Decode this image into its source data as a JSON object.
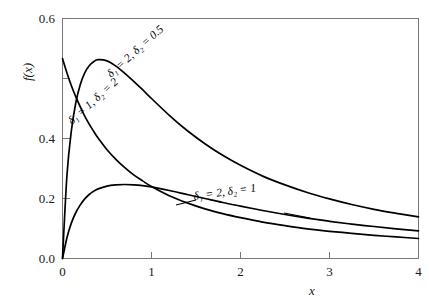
{
  "chart_data": {
    "type": "line",
    "title": "",
    "xlabel": "x",
    "ylabel": "f(x)",
    "xlim": [
      0,
      4
    ],
    "ylim": [
      0,
      0.6
    ],
    "grid": false,
    "legend_position": "inline-annotations",
    "xticks": [
      "0",
      "1",
      "2",
      "3",
      "4"
    ],
    "xtick_values": [
      0,
      1,
      2,
      3,
      4
    ],
    "yticks": [
      "0.0",
      "0.2",
      "0.4",
      "0.6"
    ],
    "ytick_values": [
      0.0,
      0.2,
      0.4,
      0.6
    ],
    "x": [
      0,
      0.05,
      0.1,
      0.15,
      0.2,
      0.25,
      0.3,
      0.35,
      0.4,
      0.5,
      0.6,
      0.7,
      0.8,
      0.9,
      1.0,
      1.2,
      1.4,
      1.6,
      1.8,
      2.0,
      2.25,
      2.5,
      2.75,
      3.0,
      3.25,
      3.5,
      3.75,
      4.0
    ],
    "series": [
      {
        "name": "d1 = 2, d2 = 0.5",
        "label": "δ₁ = 2, δ₂ = 0.5",
        "color": "#000000",
        "values": [
          0.0,
          0.208,
          0.32,
          0.39,
          0.435,
          0.464,
          0.482,
          0.492,
          0.497,
          0.494,
          0.481,
          0.463,
          0.443,
          0.422,
          0.4,
          0.358,
          0.32,
          0.287,
          0.258,
          0.233,
          0.206,
          0.184,
          0.165,
          0.149,
          0.135,
          0.123,
          0.113,
          0.104
        ]
      },
      {
        "name": "d1 = 2, d2 = 1",
        "label": "δ₁ = 2, δ₂ = 1",
        "color": "#000000",
        "values": [
          0.0,
          0.052,
          0.089,
          0.115,
          0.134,
          0.149,
          0.16,
          0.168,
          0.174,
          0.181,
          0.184,
          0.185,
          0.184,
          0.182,
          0.179,
          0.17,
          0.16,
          0.15,
          0.14,
          0.131,
          0.12,
          0.11,
          0.101,
          0.093,
          0.086,
          0.08,
          0.074,
          0.069
        ]
      },
      {
        "name": "d1 = 1, d2 = 2",
        "label": "δ₁ = 1, δ₂ = 2",
        "color": "#000000",
        "values": [
          0.5,
          0.464,
          0.432,
          0.404,
          0.379,
          0.356,
          0.336,
          0.318,
          0.301,
          0.272,
          0.248,
          0.227,
          0.209,
          0.194,
          0.18,
          0.157,
          0.139,
          0.124,
          0.112,
          0.102,
          0.091,
          0.082,
          0.074,
          0.068,
          0.063,
          0.058,
          0.054,
          0.05
        ]
      }
    ],
    "annotations": [
      {
        "text": "δ₁ = 2, δ₂ = 0.5",
        "series": "d1 = 2, d2 = 0.5",
        "rotation": -42
      },
      {
        "text": "δ₁ = 1, δ₂ = 2",
        "series": "d1 = 1, d2 = 2",
        "rotation": -42
      },
      {
        "text": "δ₁ = 2, δ₂ = 1",
        "series": "d1 = 2, d2 = 1",
        "rotation": -8
      }
    ]
  },
  "axes": {
    "y_label": "f(x)",
    "x_label": "x",
    "y_tick_0": "0.0",
    "y_tick_1": "0.2",
    "y_tick_2": "0.4",
    "y_tick_3": "0.6",
    "x_tick_0": "0",
    "x_tick_1": "1",
    "x_tick_2": "2",
    "x_tick_3": "3",
    "x_tick_4": "4"
  },
  "labels": {
    "curve_a": "δ₁ = 2, δ₂ = 0.5",
    "curve_b": "δ₁ = 1, δ₂ = 2",
    "curve_c": "δ₁ = 2, δ₂ = 1"
  },
  "colors": {
    "background": "#ffffff",
    "curve": "#000000",
    "frame": "#777777",
    "text": "#1a1a1a"
  }
}
